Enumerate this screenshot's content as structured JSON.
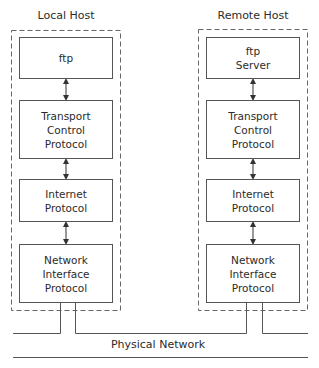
{
  "diagram": {
    "hosts": [
      {
        "title": "Local Host",
        "layers": [
          {
            "label": "ftp"
          },
          {
            "label": "Transport\nControl\nProtocol"
          },
          {
            "label": "Internet\nProtocol"
          },
          {
            "label": "Network\nInterface\nProtocol"
          }
        ]
      },
      {
        "title": "Remote Host",
        "layers": [
          {
            "label": "ftp\nServer"
          },
          {
            "label": "Transport\nControl\nProtocol"
          },
          {
            "label": "Internet\nProtocol"
          },
          {
            "label": "Network\nInterface\nProtocol"
          }
        ]
      }
    ],
    "network_label": "Physical Network",
    "colors": {
      "line": "#555555",
      "dash": "#666666",
      "text": "#2b2b2b"
    }
  }
}
